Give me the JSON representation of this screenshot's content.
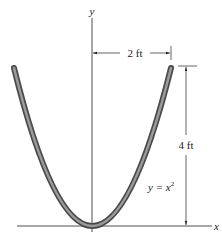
{
  "diagram": {
    "axes": {
      "x_label": "x",
      "y_label": "y"
    },
    "curve": {
      "equation_prefix": "y = x",
      "equation_exponent": "2",
      "description": "parabolic rod"
    },
    "dimensions": {
      "horizontal": "2 ft",
      "vertical": "4 ft"
    },
    "colors": {
      "rod_outer": "#4a4a4a",
      "rod_inner": "#9a9a9a",
      "line": "#222222"
    }
  }
}
